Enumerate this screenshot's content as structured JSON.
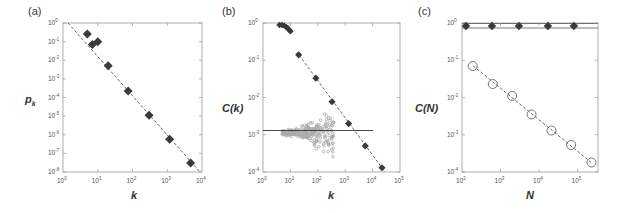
{
  "chart_data": [
    {
      "panel": "(a)",
      "type": "scatter",
      "xscale": "log",
      "yscale": "log",
      "xlabel": "k",
      "ylabel": "p_k",
      "xlim": [
        1,
        10000
      ],
      "ylim": [
        1e-08,
        1
      ],
      "xticks": [
        "10^0",
        "10^1",
        "10^2",
        "10^3",
        "10^4"
      ],
      "yticks": [
        "10^0",
        "10^-1",
        "10^-2",
        "10^-3",
        "10^-4",
        "10^-5",
        "10^-6",
        "10^-7",
        "10^-8"
      ],
      "series": [
        {
          "name": "data",
          "marker": "diamond-filled",
          "color": "#3a3a3a",
          "x": [
            5,
            7,
            10,
            20,
            75,
            300,
            1170,
            4700
          ],
          "y": [
            0.26,
            0.07,
            0.1,
            0.005,
            0.00022,
            1.1e-05,
            5.8e-07,
            3e-08
          ]
        },
        {
          "name": "power-law fit",
          "style": "dashed",
          "color": "#555555",
          "x": [
            1.6,
            8500
          ],
          "y": [
            1,
            1e-08
          ]
        }
      ],
      "grid": false
    },
    {
      "panel": "(b)",
      "type": "scatter",
      "xscale": "log",
      "yscale": "log",
      "xlabel": "k",
      "ylabel": "C(k)",
      "xlim": [
        1,
        100000
      ],
      "ylim": [
        0.0001,
        1
      ],
      "xticks": [
        "10^0",
        "10^1",
        "10^2",
        "10^3",
        "10^4",
        "10^5"
      ],
      "yticks": [
        "10^0",
        "10^-1",
        "10^-2",
        "10^-3",
        "10^-4"
      ],
      "series": [
        {
          "name": "hierarchical model",
          "marker": "diamond-filled",
          "color": "#3a3a3a",
          "x": [
            4,
            5,
            6,
            7,
            8,
            9,
            10,
            20,
            85,
            330,
            1330,
            5400,
            22000
          ],
          "y": [
            1.0,
            0.93,
            0.85,
            0.78,
            0.72,
            0.66,
            0.6,
            0.14,
            0.033,
            0.0077,
            0.002,
            0.0005,
            0.00013
          ]
        },
        {
          "name": "k^-1 fit",
          "style": "dashed",
          "color": "#555555",
          "x": [
            20,
            22000
          ],
          "y": [
            0.14,
            0.00013
          ]
        },
        {
          "name": "scale-free random (cloud)",
          "marker": "circle-open",
          "color": "#aaaaaa",
          "x_range": [
            5,
            400
          ],
          "y_center": 0.0013,
          "y_spread": [
            0.00035,
            0.003
          ]
        },
        {
          "name": "constant level",
          "style": "solid",
          "color": "#333333",
          "x": [
            1,
            10000
          ],
          "y": [
            0.0013,
            0.0013
          ]
        }
      ],
      "grid": false
    },
    {
      "panel": "(c)",
      "type": "scatter",
      "xscale": "log",
      "yscale": "log",
      "xlabel": "N",
      "ylabel": "C(N)",
      "xlim": [
        100,
        300000
      ],
      "ylim": [
        0.0001,
        1
      ],
      "xticks": [
        "10^2",
        "10^3",
        "10^4",
        "10^5"
      ],
      "yticks": [
        "10^0",
        "10^-1",
        "10^-2",
        "10^-3",
        "10^-4"
      ],
      "series": [
        {
          "name": "hierarchical model",
          "marker": "diamond-filled",
          "color": "#3a3a3a",
          "x": [
            127,
            600,
            3000,
            17000,
            80000
          ],
          "y": [
            0.8,
            0.8,
            0.76,
            0.76,
            0.76
          ]
        },
        {
          "name": "upper bound line",
          "style": "solid",
          "color": "#555555",
          "y": 1.0
        },
        {
          "name": "lower bound line",
          "style": "solid",
          "color": "#555555",
          "y": 0.74
        },
        {
          "name": "scale-free model",
          "marker": "circle-open",
          "color": "#555555",
          "x": [
            190,
            630,
            2000,
            6400,
            21000,
            68000,
            230000
          ],
          "y": [
            0.07,
            0.023,
            0.011,
            0.0035,
            0.0013,
            0.00053,
            0.00018
          ]
        },
        {
          "name": "power-law fit",
          "style": "dashed",
          "color": "#555555",
          "x": [
            190,
            230000
          ],
          "y": [
            0.07,
            0.00018
          ]
        }
      ],
      "grid": false
    }
  ],
  "labels": {
    "a": {
      "panel": "(a)",
      "xlabel": "k",
      "ylabel": "p",
      "ylabel_sub": "k"
    },
    "b": {
      "panel": "(b)",
      "xlabel": "k",
      "ylabel": "C(k)"
    },
    "c": {
      "panel": "(c)",
      "xlabel": "N",
      "ylabel": "C(N)"
    }
  },
  "ticks": {
    "a_x": [
      {
        "b": "10",
        "e": "0"
      },
      {
        "b": "10",
        "e": "1"
      },
      {
        "b": "10",
        "e": "2"
      },
      {
        "b": "10",
        "e": "3"
      },
      {
        "b": "10",
        "e": "4"
      }
    ],
    "a_y": [
      {
        "b": "10",
        "e": "0"
      },
      {
        "b": "10",
        "e": "-1"
      },
      {
        "b": "10",
        "e": "-2"
      },
      {
        "b": "10",
        "e": "-3"
      },
      {
        "b": "10",
        "e": "-4"
      },
      {
        "b": "10",
        "e": "-5"
      },
      {
        "b": "10",
        "e": "-6"
      },
      {
        "b": "10",
        "e": "-7"
      },
      {
        "b": "10",
        "e": "-8"
      }
    ],
    "b_x": [
      {
        "b": "10",
        "e": "0"
      },
      {
        "b": "10",
        "e": "1"
      },
      {
        "b": "10",
        "e": "2"
      },
      {
        "b": "10",
        "e": "3"
      },
      {
        "b": "10",
        "e": "4"
      },
      {
        "b": "10",
        "e": "5"
      }
    ],
    "b_y": [
      {
        "b": "10",
        "e": "0"
      },
      {
        "b": "10",
        "e": "-1"
      },
      {
        "b": "10",
        "e": "-2"
      },
      {
        "b": "10",
        "e": "-3"
      },
      {
        "b": "10",
        "e": "-4"
      }
    ],
    "c_x": [
      {
        "b": "10",
        "e": "2"
      },
      {
        "b": "10",
        "e": "3"
      },
      {
        "b": "10",
        "e": "4"
      },
      {
        "b": "10",
        "e": "5"
      }
    ],
    "c_y": [
      {
        "b": "10",
        "e": "0"
      },
      {
        "b": "10",
        "e": "-1"
      },
      {
        "b": "10",
        "e": "-2"
      },
      {
        "b": "10",
        "e": "-3"
      },
      {
        "b": "10",
        "e": "-4"
      }
    ]
  },
  "colors": {
    "marker": "#3a3a3a",
    "axis": "#999999",
    "fit_line": "#555555",
    "cloud": "#a8a8a8"
  }
}
